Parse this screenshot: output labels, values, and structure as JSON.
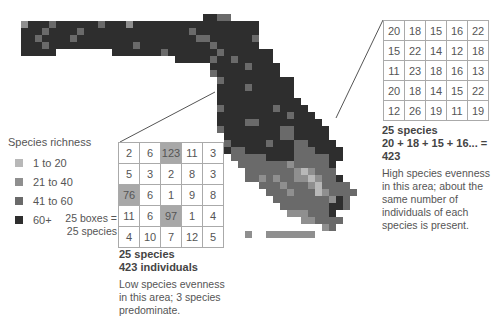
{
  "legend": {
    "title": "Species richness",
    "items": [
      {
        "label": "1 to 20",
        "color": "#b8b8b8"
      },
      {
        "label": "21 to 40",
        "color": "#8f8f8f"
      },
      {
        "label": "41 to 60",
        "color": "#6a6a6a"
      },
      {
        "label": "60+",
        "color": "#2e2e2e"
      }
    ]
  },
  "left_sample": {
    "boxes_label_line1": "25 boxes =",
    "boxes_label_line2": "25 species",
    "grid": [
      [
        2,
        6,
        123,
        11,
        3
      ],
      [
        5,
        3,
        2,
        8,
        3
      ],
      [
        76,
        6,
        1,
        9,
        8
      ],
      [
        11,
        6,
        97,
        1,
        4
      ],
      [
        4,
        10,
        7,
        12,
        5
      ]
    ],
    "highlighted": [
      123,
      76,
      97
    ],
    "heading_line1": "25 species",
    "heading_line2": "423 individuals",
    "description": "Low species evenness in this area; 3 species predominate."
  },
  "right_sample": {
    "grid": [
      [
        20,
        18,
        15,
        16,
        22
      ],
      [
        15,
        22,
        14,
        12,
        18
      ],
      [
        11,
        23,
        18,
        16,
        13
      ],
      [
        20,
        18,
        14,
        15,
        22
      ],
      [
        12,
        26,
        19,
        11,
        19
      ]
    ],
    "heading_line1": "25 species",
    "heading_line2": "20 + 18 + 15 + 16... = 423",
    "description": "High species evenness in this area; about the same number of individuals of each species is present."
  },
  "map": {
    "cell": 7,
    "origin_x": 21,
    "origin_y": 14,
    "palette": {
      "1": "#b8b8b8",
      "2": "#8f8f8f",
      "3": "#6a6a6a",
      "4": "#2e2e2e"
    },
    "rows": [
      "..........................4433......................",
      "2444344444434442444444444444444444..................",
      "4443444434444444444444443444444444..................",
      "4434444344444444444444444334444443..................",
      "4443444444444444344444444443444444..................",
      "44444........44444443444444434444444................",
      "......................44444344344444................",
      "...........................4444434444...............",
      "...........................3444444444...............",
      "............................34444444444.............",
      "............................44443444444.............",
      "............................44444444444.............",
      "............................444444444444............",
      "............................3444444434444...........",
      "............................44444444443444..........",
      "............................444433444444444.........",
      "............................3444444443344444........",
      ".............................444444443344444........",
      ".............................3444443444334444.......",
      ".............................43344444443334444......",
      "..............................3333344443333344......",
      "...............................33333332333334......",
      "................................3333333212333......",
      "................................33232332212334.....",
      "..................................3332333213333....",
      "...................................3332333123333...",
      "....................................33333333243.....",
      ".....................................3333333443.....",
      "......................................2223334......",
      "........................................223333.....",
      "...........................................23......",
      "................................2..2222222........."
    ]
  },
  "connectors": {
    "left": {
      "x1": 120,
      "y1": 142,
      "x2": 215,
      "y2": 92
    },
    "right": {
      "x1": 383,
      "y1": 20,
      "x2": 336,
      "y2": 118
    }
  }
}
